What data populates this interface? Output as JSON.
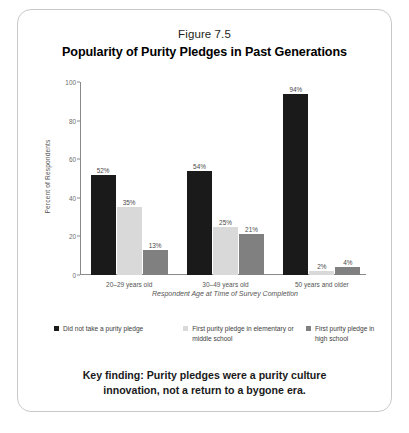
{
  "figure": {
    "number_label": "Figure 7.5",
    "title": "Popularity of Purity Pledges in Past Generations",
    "key_finding": "Key finding: Purity pledges were a purity culture innovation, not a return to a bygone era."
  },
  "colors": {
    "series_1": "#1a1a1a",
    "series_2": "#d9d9d9",
    "series_3": "#808080",
    "axis": "#8a8a8a",
    "frame": "#c9c9c9",
    "background": "#ffffff"
  },
  "chart_data": {
    "type": "bar",
    "title": "Popularity of Purity Pledges in Past Generations",
    "xlabel": "Respondent Age at Time of Survey Completion",
    "ylabel": "Percent of Respondents",
    "ylim": [
      0,
      100
    ],
    "yticks": [
      0,
      20,
      40,
      60,
      80,
      100
    ],
    "ytick_labels": [
      "0",
      "20",
      "40",
      "60",
      "80",
      "100"
    ],
    "grid": false,
    "legend_position": "below",
    "categories": [
      "20–29 years old",
      "30–49 years old",
      "50 years and older"
    ],
    "series": [
      {
        "name": "Did not take a purity pledge",
        "color": "#1a1a1a",
        "values": [
          52,
          54,
          94
        ],
        "labels": [
          "52%",
          "54%",
          "94%"
        ]
      },
      {
        "name": "First purity pledge in elementary or middle school",
        "color": "#d9d9d9",
        "values": [
          35,
          25,
          2
        ],
        "labels": [
          "35%",
          "25%",
          "2%"
        ]
      },
      {
        "name": "First purity pledge in high school",
        "color": "#808080",
        "values": [
          13,
          21,
          4
        ],
        "labels": [
          "13%",
          "21%",
          "4%"
        ]
      }
    ],
    "legend_entries": [
      "Did not take a purity pledge",
      "First purity pledge in elementary or middle school",
      "First purity pledge in high school"
    ]
  }
}
